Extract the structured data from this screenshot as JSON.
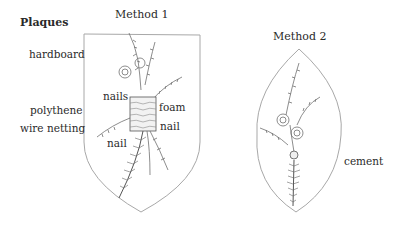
{
  "title": "Plaques",
  "method1": {
    "heading": "Method 1",
    "labels": {
      "hardboard": "hardboard",
      "polythene": "polythene",
      "wire_netting": "wire netting",
      "nails": "nails",
      "foam": "foam",
      "nail_right": "nail",
      "nail_left": "nail"
    }
  },
  "method2": {
    "heading": "Method 2",
    "labels": {
      "cement": "cement"
    }
  },
  "colors": {
    "outline": "#9a9a9a",
    "sketch": "#6e6e6e",
    "text": "#2a2a2a"
  }
}
